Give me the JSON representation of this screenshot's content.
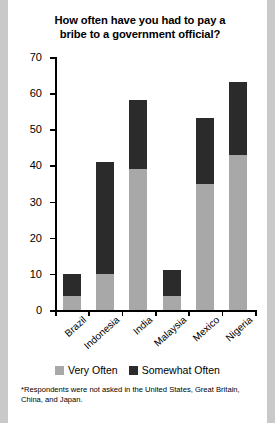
{
  "chart_data": {
    "type": "bar",
    "title": "How often have you had to pay a bribe to a government official?",
    "title_line1": "How often have you had to pay a",
    "title_line2": "bribe to a government official?",
    "xlabel": "",
    "ylabel": "",
    "ylim": [
      0,
      70
    ],
    "yticks": [
      0,
      10,
      20,
      30,
      40,
      50,
      60,
      70
    ],
    "grid": false,
    "stacked": true,
    "legend_position": "bottom",
    "categories": [
      "Brazil",
      "Indonesia",
      "India",
      "Malaysia",
      "Mexico",
      "Nigeria"
    ],
    "series": [
      {
        "name": "Very Often",
        "color": "#a8a8a8",
        "values": [
          4,
          10,
          39,
          4,
          35,
          43
        ]
      },
      {
        "name": "Somewhat Often",
        "color": "#2b2b2b",
        "values": [
          6,
          31,
          19,
          7,
          18,
          20
        ]
      }
    ],
    "totals": [
      10,
      41,
      58,
      11,
      53,
      63
    ],
    "footnote": "*Respondents were not asked in the  United States, Great Britain, China, and Japan."
  }
}
